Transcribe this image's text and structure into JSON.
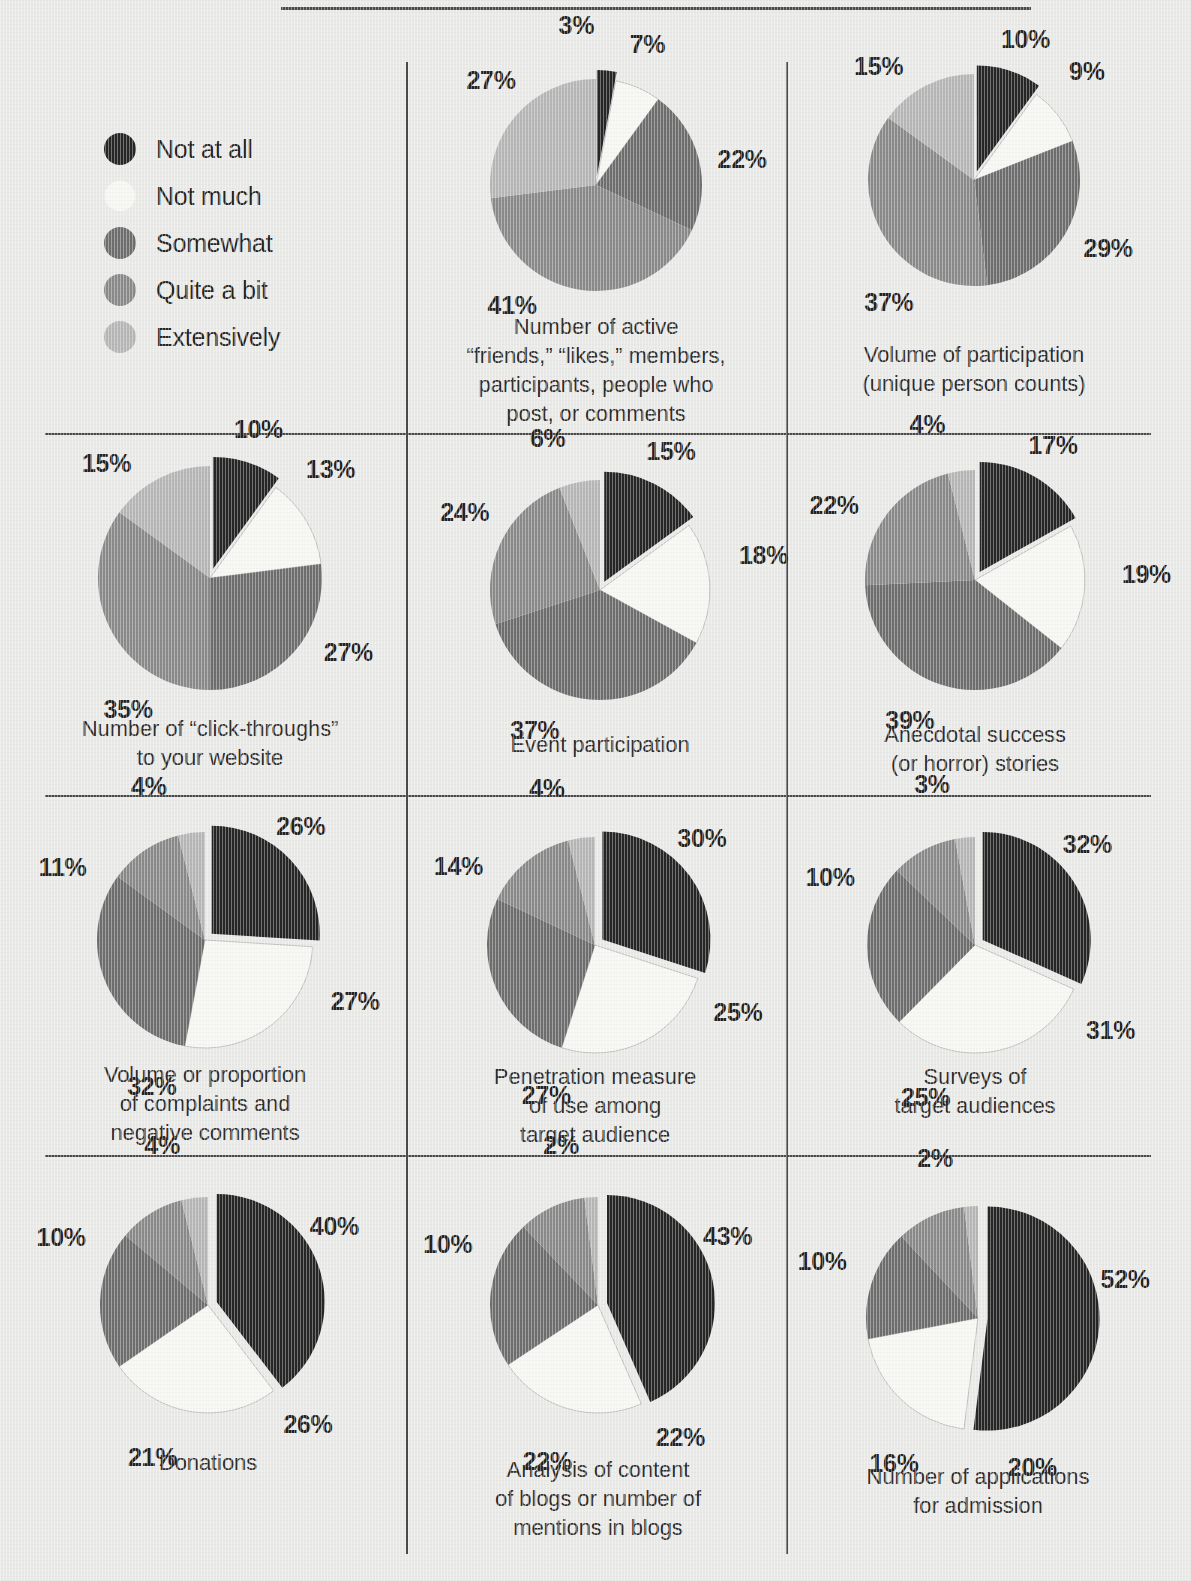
{
  "figure": {
    "top_rule": true,
    "background_color": "#e9e9e7"
  },
  "legend": {
    "title": "",
    "items": [
      {
        "label": "Not at all",
        "color": "#262626"
      },
      {
        "label": "Not much",
        "color": "#f6f6f3"
      },
      {
        "label": "Somewhat",
        "color": "#6e6e6e"
      },
      {
        "label": "Quite a bit",
        "color": "#8a8a8a"
      },
      {
        "label": "Extensively",
        "color": "#b6b6b6"
      }
    ]
  },
  "chart_data": [
    {
      "type": "pie",
      "title": "Number of active\n“friends,” “likes,” members,\nparticipants, people who\npost, or comments",
      "categories": [
        "Not at all",
        "Not much",
        "Somewhat",
        "Quite a bit",
        "Extensively"
      ],
      "values": [
        3,
        7,
        22,
        41,
        27
      ],
      "labels": [
        "3%",
        "7%",
        "22%",
        "41%",
        "27%"
      ],
      "exploded": [
        "Not at all"
      ],
      "legend_position": "left-panel"
    },
    {
      "type": "pie",
      "title": "Volume of participation\n(unique person counts)",
      "categories": [
        "Not at all",
        "Not much",
        "Somewhat",
        "Quite a bit",
        "Extensively"
      ],
      "values": [
        10,
        9,
        29,
        37,
        15
      ],
      "labels": [
        "10%",
        "9%",
        "29%",
        "37%",
        "15%"
      ],
      "exploded": [
        "Not at all"
      ],
      "legend_position": "left-panel"
    },
    {
      "type": "pie",
      "title": "Number of “click-throughs”\nto your website",
      "categories": [
        "Not at all",
        "Not much",
        "Somewhat",
        "Quite a bit",
        "Extensively"
      ],
      "values": [
        10,
        13,
        27,
        35,
        15
      ],
      "labels": [
        "10%",
        "13%",
        "27%",
        "35%",
        "15%"
      ],
      "exploded": [
        "Not at all"
      ],
      "legend_position": "left-panel"
    },
    {
      "type": "pie",
      "title": "Event participation",
      "categories": [
        "Not at all",
        "Not much",
        "Somewhat",
        "Quite a bit",
        "Extensively"
      ],
      "values": [
        15,
        18,
        37,
        24,
        6
      ],
      "labels": [
        "15%",
        "18%",
        "37%",
        "24%",
        "6%"
      ],
      "exploded": [
        "Not at all"
      ],
      "legend_position": "left-panel"
    },
    {
      "type": "pie",
      "title": "Anecdotal success\n(or horror) stories",
      "categories": [
        "Not at all",
        "Not much",
        "Somewhat",
        "Quite a bit",
        "Extensively"
      ],
      "values": [
        17,
        19,
        39,
        22,
        4
      ],
      "labels": [
        "17%",
        "19%",
        "39%",
        "22%",
        "4%"
      ],
      "exploded": [
        "Not at all"
      ],
      "legend_position": "left-panel"
    },
    {
      "type": "pie",
      "title": "Volume or proportion\nof complaints and\nnegative comments",
      "categories": [
        "Not at all",
        "Not much",
        "Somewhat",
        "Quite a bit",
        "Extensively"
      ],
      "values": [
        26,
        27,
        32,
        11,
        4
      ],
      "labels": [
        "26%",
        "27%",
        "32%",
        "11%",
        "4%"
      ],
      "exploded": [
        "Not at all"
      ],
      "legend_position": "left-panel"
    },
    {
      "type": "pie",
      "title": "Penetration measure\nof use among\ntarget audience",
      "categories": [
        "Not at all",
        "Not much",
        "Somewhat",
        "Quite a bit",
        "Extensively"
      ],
      "values": [
        30,
        25,
        27,
        14,
        4
      ],
      "labels": [
        "30%",
        "25%",
        "27%",
        "14%",
        "4%"
      ],
      "exploded": [
        "Not at all"
      ],
      "legend_position": "left-panel"
    },
    {
      "type": "pie",
      "title": "Surveys of\ntarget audiences",
      "categories": [
        "Not at all",
        "Not much",
        "Somewhat",
        "Quite a bit",
        "Extensively"
      ],
      "values": [
        32,
        31,
        25,
        10,
        3
      ],
      "labels": [
        "32%",
        "31%",
        "25%",
        "10%",
        "3%"
      ],
      "exploded": [
        "Not at all"
      ],
      "legend_position": "left-panel"
    },
    {
      "type": "pie",
      "title": "Donations",
      "categories": [
        "Not at all",
        "Not much",
        "Somewhat",
        "Quite a bit",
        "Extensively"
      ],
      "values": [
        40,
        26,
        21,
        10,
        4
      ],
      "labels": [
        "40%",
        "26%",
        "21%",
        "10%",
        "4%"
      ],
      "exploded": [
        "Not at all"
      ],
      "legend_position": "left-panel"
    },
    {
      "type": "pie",
      "title": "Analysis of content\nof blogs or number of\nmentions in blogs",
      "categories": [
        "Not at all",
        "Not much",
        "Somewhat",
        "Quite a bit",
        "Extensively"
      ],
      "values": [
        43,
        22,
        22,
        10,
        2
      ],
      "labels": [
        "43%",
        "22%",
        "22%",
        "10%",
        "2%"
      ],
      "exploded": [
        "Not at all"
      ],
      "legend_position": "left-panel"
    },
    {
      "type": "pie",
      "title": "Number of applications\nfor admission",
      "categories": [
        "Not at all",
        "Not much",
        "Somewhat",
        "Quite a bit",
        "Extensively"
      ],
      "values": [
        52,
        20,
        16,
        10,
        2
      ],
      "labels": [
        "52%",
        "20%",
        "16%",
        "10%",
        "2%"
      ],
      "exploded": [
        "Not at all"
      ],
      "legend_position": "left-panel"
    }
  ],
  "layout": {
    "columns": 3,
    "rows": 4,
    "legend_cell": "row1-col1",
    "cells": [
      {
        "chart": 0,
        "cx": 596,
        "cy": 185,
        "r": 106,
        "cap_y": 312
      },
      {
        "chart": 1,
        "cx": 974,
        "cy": 180,
        "r": 106,
        "cap_y": 340
      },
      {
        "chart": 2,
        "cx": 210,
        "cy": 578,
        "r": 112,
        "cap_y": 714
      },
      {
        "chart": 3,
        "cx": 600,
        "cy": 590,
        "r": 110,
        "cap_y": 730
      },
      {
        "chart": 4,
        "cx": 975,
        "cy": 580,
        "r": 110,
        "cap_y": 720
      },
      {
        "chart": 5,
        "cx": 205,
        "cy": 940,
        "r": 108,
        "cap_y": 1060
      },
      {
        "chart": 6,
        "cx": 595,
        "cy": 945,
        "r": 108,
        "cap_y": 1062
      },
      {
        "chart": 7,
        "cx": 975,
        "cy": 945,
        "r": 108,
        "cap_y": 1062
      },
      {
        "chart": 8,
        "cx": 208,
        "cy": 1305,
        "r": 108,
        "cap_y": 1448
      },
      {
        "chart": 9,
        "cx": 598,
        "cy": 1305,
        "r": 108,
        "cap_y": 1455
      },
      {
        "chart": 10,
        "cx": 978,
        "cy": 1318,
        "r": 112,
        "cap_y": 1462
      }
    ],
    "label_offsets": [
      [
        {
          "a": -7,
          "d": 1.52
        },
        {
          "a": 20,
          "d": 1.42
        },
        {
          "a": 80,
          "d": 1.4
        },
        {
          "a": 215,
          "d": 1.38
        },
        {
          "a": 315,
          "d": 1.4
        }
      ],
      [
        {
          "a": 20,
          "d": 1.42
        },
        {
          "a": 46,
          "d": 1.48
        },
        {
          "a": 117,
          "d": 1.42
        },
        {
          "a": 215,
          "d": 1.4
        },
        {
          "a": 320,
          "d": 1.4
        }
      ],
      [
        {
          "a": 18,
          "d": 1.4
        },
        {
          "a": 48,
          "d": 1.45
        },
        {
          "a": 118,
          "d": 1.4
        },
        {
          "a": 212,
          "d": 1.38
        },
        {
          "a": 318,
          "d": 1.38
        }
      ],
      [
        {
          "a": 27,
          "d": 1.42
        },
        {
          "a": 78,
          "d": 1.52
        },
        {
          "a": 205,
          "d": 1.4
        },
        {
          "a": 300,
          "d": 1.42
        },
        {
          "a": 341,
          "d": 1.46
        }
      ],
      [
        {
          "a": 30,
          "d": 1.42
        },
        {
          "a": 88,
          "d": 1.56
        },
        {
          "a": 205,
          "d": 1.4
        },
        {
          "a": 298,
          "d": 1.45
        },
        {
          "a": 343,
          "d": 1.48
        }
      ],
      [
        {
          "a": 40,
          "d": 1.38
        },
        {
          "a": 112,
          "d": 1.5
        },
        {
          "a": 200,
          "d": 1.44
        },
        {
          "a": 297,
          "d": 1.48
        },
        {
          "a": 340,
          "d": 1.52
        }
      ],
      [
        {
          "a": 45,
          "d": 1.4
        },
        {
          "a": 115,
          "d": 1.46
        },
        {
          "a": 198,
          "d": 1.46
        },
        {
          "a": 300,
          "d": 1.46
        },
        {
          "a": 343,
          "d": 1.52
        }
      ],
      [
        {
          "a": 48,
          "d": 1.4
        },
        {
          "a": 122,
          "d": 1.48
        },
        {
          "a": 198,
          "d": 1.48
        },
        {
          "a": 295,
          "d": 1.48
        },
        {
          "a": 345,
          "d": 1.54
        }
      ],
      [
        {
          "a": 58,
          "d": 1.38
        },
        {
          "a": 140,
          "d": 1.44
        },
        {
          "a": 200,
          "d": 1.5
        },
        {
          "a": 295,
          "d": 1.5
        },
        {
          "a": 344,
          "d": 1.54
        }
      ],
      [
        {
          "a": 62,
          "d": 1.36
        },
        {
          "a": 148,
          "d": 1.44
        },
        {
          "a": 198,
          "d": 1.52
        },
        {
          "a": 292,
          "d": 1.5
        },
        {
          "a": 347,
          "d": 1.52
        }
      ],
      [
        {
          "a": 75,
          "d": 1.36
        },
        {
          "a": 160,
          "d": 1.42
        },
        {
          "a": 210,
          "d": 1.5
        },
        {
          "a": 290,
          "d": 1.48
        },
        {
          "a": 345,
          "d": 1.48
        }
      ]
    ]
  }
}
